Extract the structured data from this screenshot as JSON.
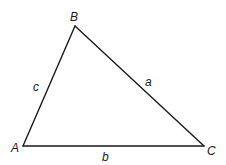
{
  "diagram": {
    "type": "triangle",
    "vertices": {
      "A": {
        "label": "A",
        "x": 23,
        "y": 146
      },
      "B": {
        "label": "B",
        "x": 75,
        "y": 26
      },
      "C": {
        "label": "C",
        "x": 204,
        "y": 146
      }
    },
    "sides": {
      "a": {
        "label": "a",
        "from": "B",
        "to": "C"
      },
      "b": {
        "label": "b",
        "from": "A",
        "to": "C"
      },
      "c": {
        "label": "c",
        "from": "A",
        "to": "B"
      }
    },
    "stroke_color": "#1a1a1a",
    "background": "#ffffff"
  }
}
